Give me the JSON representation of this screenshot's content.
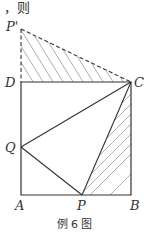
{
  "header_text": "，则",
  "labels": {
    "P_prime": "P'",
    "D": "D",
    "C": "C",
    "Q": "Q",
    "A": "A",
    "P": "P",
    "B": "B"
  },
  "caption": "例 6 图",
  "colors": {
    "line": "#333333",
    "hatch": "#9a9a9a"
  }
}
